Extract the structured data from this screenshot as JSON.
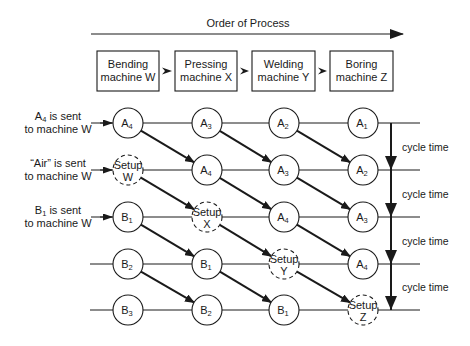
{
  "title": "Order of Process",
  "machines": [
    {
      "line1": "Bending",
      "line2": "machine W"
    },
    {
      "line1": "Pressing",
      "line2": "machine X"
    },
    {
      "line1": "Welding",
      "line2": "machine Y"
    },
    {
      "line1": "Boring",
      "line2": "machine Z"
    }
  ],
  "row_labels": [
    {
      "line1_main": "A",
      "line1_sub": "4",
      "line1_rest": " is sent",
      "line2": "to machine W"
    },
    {
      "line1_main": "“Air”",
      "line1_sub": "",
      "line1_rest": " is sent",
      "line2": "to machine W"
    },
    {
      "line1_main": "B",
      "line1_sub": "1",
      "line1_rest": " is sent",
      "line2": "to machine W"
    }
  ],
  "grid": [
    [
      {
        "main": "A",
        "sub": "4"
      },
      {
        "main": "A",
        "sub": "3"
      },
      {
        "main": "A",
        "sub": "2"
      },
      {
        "main": "A",
        "sub": "1"
      }
    ],
    [
      {
        "setup": "W"
      },
      {
        "main": "A",
        "sub": "4"
      },
      {
        "main": "A",
        "sub": "3"
      },
      {
        "main": "A",
        "sub": "2"
      }
    ],
    [
      {
        "main": "B",
        "sub": "1"
      },
      {
        "setup": "X"
      },
      {
        "main": "A",
        "sub": "4"
      },
      {
        "main": "A",
        "sub": "3"
      }
    ],
    [
      {
        "main": "B",
        "sub": "2"
      },
      {
        "main": "B",
        "sub": "1"
      },
      {
        "setup": "Y"
      },
      {
        "main": "A",
        "sub": "4"
      }
    ],
    [
      {
        "main": "B",
        "sub": "3"
      },
      {
        "main": "B",
        "sub": "2"
      },
      {
        "main": "B",
        "sub": "1"
      },
      {
        "setup": "Z"
      }
    ]
  ],
  "setup_word": "Setup",
  "cycle_label": "cycle time",
  "cycle_count": 4,
  "colors": {
    "ink": "#1a1a1a",
    "background": "#ffffff"
  }
}
